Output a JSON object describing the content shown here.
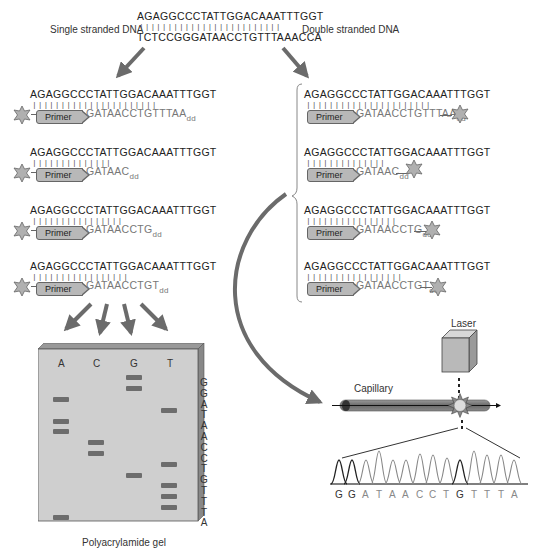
{
  "top": {
    "template_strand": "AGAGGCCCTATTGGACAAATTTGGT",
    "pairing_ticks": "|||||||||||||||||||||||||",
    "complement_strand": "TCTCCGGGATAACCTGTTTAAACCA",
    "left_label": "Single stranded DNA",
    "right_label": "Double stranded DNA"
  },
  "left_method": {
    "rows": [
      {
        "template": "AGAGGCCCTATTGGACAAATTTGGT",
        "ticks": "||||||||||||||||||||||",
        "primer_label": "Primer",
        "extension": "GATAACCTGTTTAA",
        "terminator": "dd"
      },
      {
        "template": "AGAGGCCCTATTGGACAAATTTGGT",
        "ticks": "||||||||||||||",
        "primer_label": "Primer",
        "extension": "GATAAC",
        "terminator": "dd"
      },
      {
        "template": "AGAGGCCCTATTGGACAAATTTGGT",
        "ticks": "||||||||||||||||",
        "primer_label": "Primer",
        "extension": "GATAACCTG",
        "terminator": "dd"
      },
      {
        "template": "AGAGGCCCTATTGGACAAATTTGGT",
        "ticks": "|||||||||||||||||",
        "primer_label": "Primer",
        "extension": "GATAACCTGT",
        "terminator": "dd"
      }
    ]
  },
  "right_method": {
    "rows": [
      {
        "template": "AGAGGCCCTATTGGACAAATTTGGT",
        "ticks": "||||||||||||||||||||||",
        "primer_label": "Primer",
        "extension": "GATAACCTGTTTAA",
        "terminator": "dd"
      },
      {
        "template": "AGAGGCCCTATTGGACAAATTTGGT",
        "ticks": "||||||||||||||",
        "primer_label": "Primer",
        "extension": "GATAAC",
        "terminator": "dd"
      },
      {
        "template": "AGAGGCCCTATTGGACAAATTTGGT",
        "ticks": "||||||||||||||||",
        "primer_label": "Primer",
        "extension": "GATAACCTG",
        "terminator": "dd"
      },
      {
        "template": "AGAGGCCCTATTGGACAAATTTGGT",
        "ticks": "|||||||||||||||||",
        "primer_label": "Primer",
        "extension": "GATAACCTGT",
        "terminator": "dd"
      }
    ]
  },
  "gel": {
    "label": "Polyacrylamide gel",
    "lanes": [
      "A",
      "C",
      "G",
      "T"
    ],
    "read_sequence": [
      "G",
      "G",
      "A",
      "T",
      "A",
      "A",
      "C",
      "C",
      "T",
      "G",
      "T",
      "T",
      "T",
      "A"
    ],
    "bands": {
      "A": [
        3,
        5,
        6,
        14
      ],
      "C": [
        7,
        8
      ],
      "G": [
        1,
        2,
        10
      ],
      "T": [
        4,
        9,
        11,
        12,
        13
      ]
    }
  },
  "capillary": {
    "laser_label": "Laser",
    "capillary_label": "Capillary"
  },
  "chromatogram": {
    "bases": [
      "G",
      "G",
      "A",
      "T",
      "A",
      "A",
      "C",
      "C",
      "T",
      "G",
      "T",
      "T",
      "T",
      "A"
    ],
    "peak_heights": [
      0.72,
      0.72,
      0.72,
      1.0,
      0.72,
      0.72,
      0.88,
      0.85,
      0.78,
      0.72,
      1.0,
      0.9,
      0.88,
      0.75
    ],
    "dark_bases": [
      0,
      1,
      9
    ]
  },
  "colors": {
    "arrow": "#6b6b6b",
    "gel_bg": "#cfcfcf",
    "band": "#6d6d6d",
    "primer_fill": "#b8b8b8",
    "star_fill": "#b0b0b0"
  }
}
